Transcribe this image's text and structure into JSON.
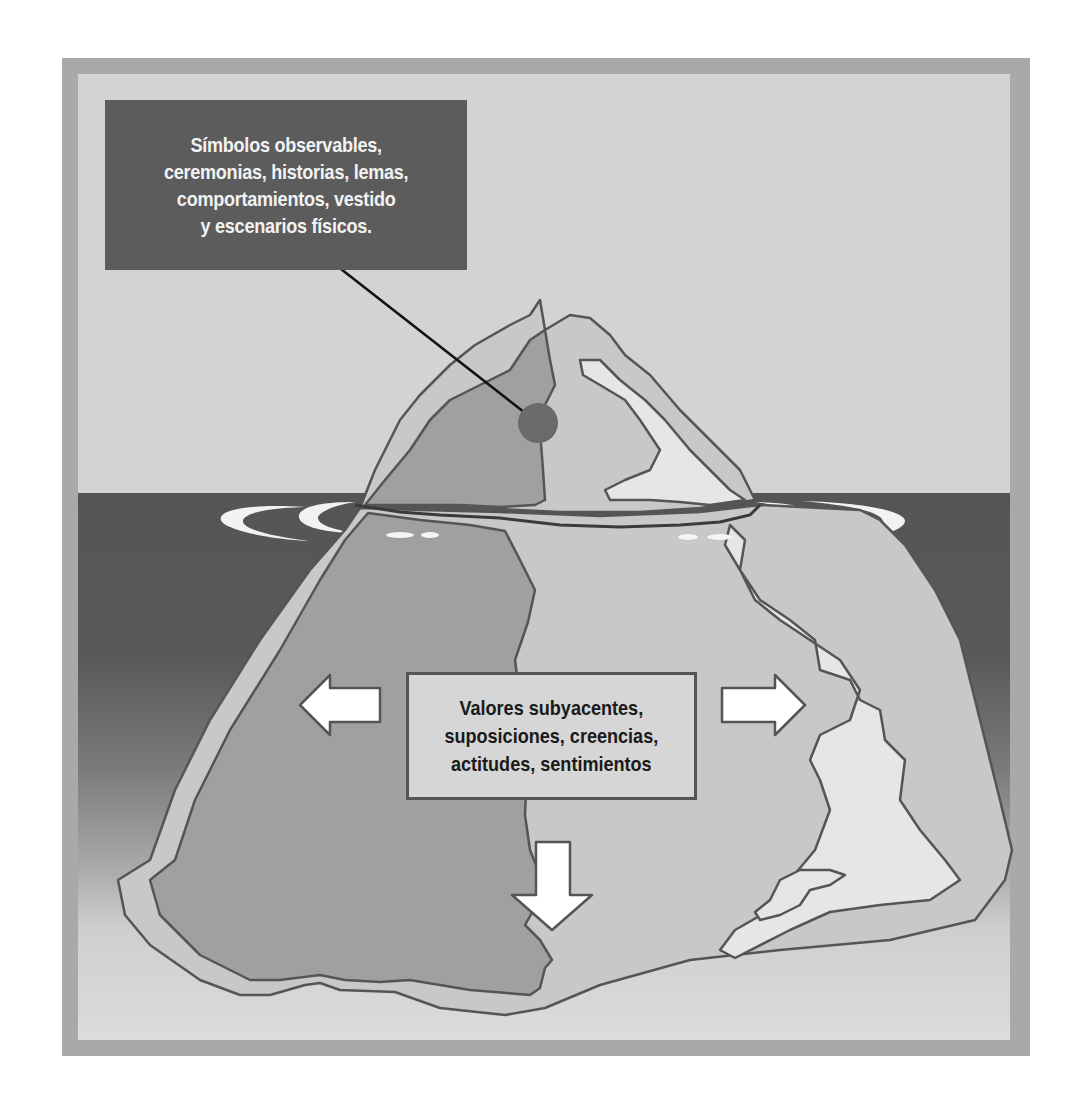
{
  "figure": {
    "top_callout": {
      "text": "Símbolos observables,\nceremonias, historias, lemas,\ncomportamientos, vestido\ny escenarios físicos."
    },
    "bottom_callout": {
      "text": "Valores subyacentes,\nsuposiciones, creencias,\nactitudes, sentimientos"
    },
    "arrows": [
      {
        "direction": "left",
        "icon": "arrow-left-icon"
      },
      {
        "direction": "right",
        "icon": "arrow-right-icon"
      },
      {
        "direction": "down",
        "icon": "arrow-down-icon"
      }
    ],
    "colors": {
      "frame_border": "#a9a9a9",
      "background": "#d3d3d3",
      "water": "#555555",
      "callout_top_bg": "#5c5c5c",
      "callout_top_text": "#f2f2f2",
      "callout_bottom_bg": "#d6d6d6",
      "iceberg_dark": "#a0a0a0",
      "iceberg_mid": "#bdbdbd",
      "iceberg_light": "#e6e6e6",
      "outline": "#555555",
      "pointer_dot": "#6a6a6a"
    }
  }
}
